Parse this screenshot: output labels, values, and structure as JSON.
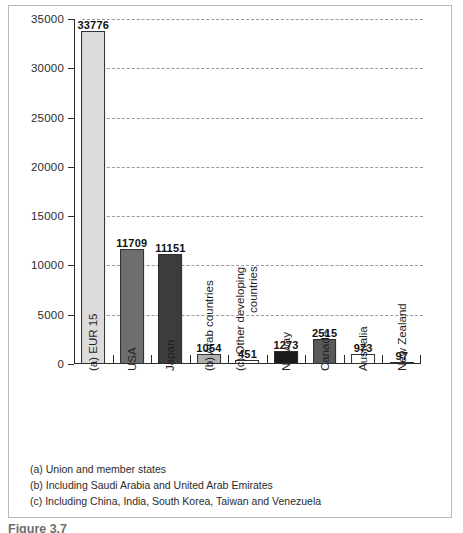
{
  "chart_data": {
    "type": "bar",
    "title": "",
    "xlabel": "",
    "ylabel": "",
    "ylim": [
      0,
      35000
    ],
    "ytick_step": 5000,
    "yticks": [
      "35000",
      "30000",
      "25000",
      "20000",
      "15000",
      "10000",
      "5000",
      "0"
    ],
    "grid": "horizontal-dashed",
    "legend": "none",
    "categories": [
      "(a) EUR 15",
      "USA",
      "Japan",
      "(b) Arab countries",
      "(c) Other developing countries",
      "Norway",
      "Canada",
      "Australia",
      "New Zealand"
    ],
    "values": [
      33776,
      11709,
      11151,
      1054,
      451,
      1273,
      2515,
      973,
      97
    ],
    "value_labels": [
      "33776",
      "11709",
      "11151",
      "1054",
      "451",
      "1273",
      "2515",
      "973",
      "97"
    ],
    "bar_colors": [
      "#dcdcdc",
      "#6e6e6e",
      "#3c3c3c",
      "#b0b0b0",
      "#ffffff",
      "#1a1a1a",
      "#5a5a5a",
      "#ffffff",
      "#ffffff"
    ],
    "bars": [
      {
        "label": "(a) EUR 15",
        "label_line2": "",
        "value": 33776,
        "value_label": "33776",
        "color": "#dcdcdc"
      },
      {
        "label": "USA",
        "label_line2": "",
        "value": 11709,
        "value_label": "11709",
        "color": "#6e6e6e"
      },
      {
        "label": "Japan",
        "label_line2": "",
        "value": 11151,
        "value_label": "11151",
        "color": "#3c3c3c"
      },
      {
        "label": "(b) Arab countries",
        "label_line2": "",
        "value": 1054,
        "value_label": "1054",
        "color": "#b0b0b0"
      },
      {
        "label": "(c) Other developing",
        "label_line2": "countries",
        "value": 451,
        "value_label": "451",
        "color": "#ffffff"
      },
      {
        "label": "Norway",
        "label_line2": "",
        "value": 1273,
        "value_label": "1273",
        "color": "#1a1a1a"
      },
      {
        "label": "Canada",
        "label_line2": "",
        "value": 2515,
        "value_label": "2515",
        "color": "#5a5a5a"
      },
      {
        "label": "Australia",
        "label_line2": "",
        "value": 973,
        "value_label": "973",
        "color": "#ffffff"
      },
      {
        "label": "New Zealand",
        "label_line2": "",
        "value": 97,
        "value_label": "97",
        "color": "#ffffff"
      }
    ]
  },
  "footnotes": [
    "(a) Union and member states",
    "(b) Including Saudi Arabia and United Arab Emirates",
    "(c) Including China, India, South Korea, Taiwan and Venezuela"
  ],
  "caption": "Figure 3.7",
  "colors": {
    "axis": "#2a2a2a",
    "grid": "#9a9a9a",
    "frame": "#b9b9b9",
    "text": "#1f1f1f"
  }
}
